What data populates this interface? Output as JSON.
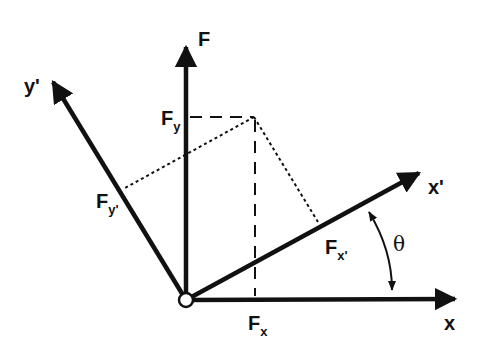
{
  "diagram": {
    "colors": {
      "ink": "#111111",
      "background": "#ffffff"
    },
    "origin": {
      "x": 186,
      "y": 300
    },
    "axes": [
      {
        "id": "x",
        "label": "x",
        "tip": {
          "x": 455,
          "y": 299
        }
      },
      {
        "id": "F",
        "label": "F",
        "tip": {
          "x": 186,
          "y": 47
        }
      },
      {
        "id": "x-prime",
        "label": "x'",
        "tip": {
          "x": 419,
          "y": 173
        }
      },
      {
        "id": "y-prime",
        "label": "y'",
        "tip": {
          "x": 53,
          "y": 82
        }
      }
    ],
    "labels": {
      "F": "F",
      "x": "x",
      "x_prime": "x'",
      "y_prime": "y'",
      "Fx_main": "F",
      "Fx_sub": "x",
      "Fy_main": "F",
      "Fy_sub": "y",
      "Fxp_main": "F",
      "Fxp_sub": "x'",
      "Fyp_main": "F",
      "Fyp_sub": "y'",
      "theta": "θ"
    },
    "projections": {
      "force_tip": {
        "x": 254,
        "y": 117
      },
      "Fx_foot": {
        "x": 255,
        "y": 300
      },
      "Fy_foot": {
        "x": 186,
        "y": 117
      },
      "Fxp_foot": {
        "x": 318,
        "y": 222
      },
      "Fyp_foot": {
        "x": 125,
        "y": 188
      }
    }
  }
}
